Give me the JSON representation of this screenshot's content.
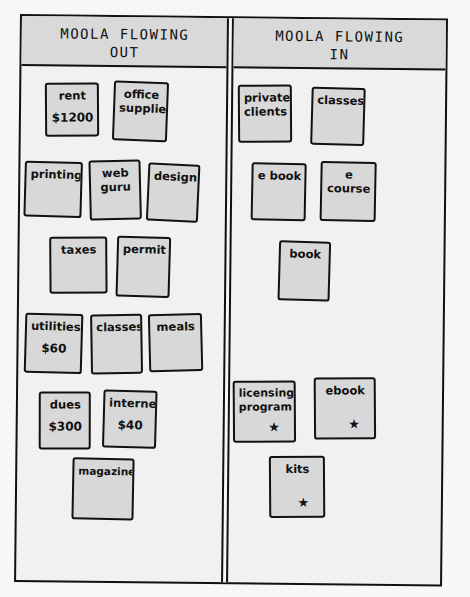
{
  "columns": {
    "out": {
      "title_line1": "MOOLA FLOWING",
      "title_line2": "OUT",
      "notes": [
        {
          "label": "rent",
          "amount": "$1200"
        },
        {
          "label": "office supplies",
          "amount": ""
        },
        {
          "label": "printing",
          "amount": ""
        },
        {
          "label": "web guru",
          "amount": ""
        },
        {
          "label": "design",
          "amount": ""
        },
        {
          "label": "taxes",
          "amount": ""
        },
        {
          "label": "permit",
          "amount": ""
        },
        {
          "label": "utilities",
          "amount": "$60"
        },
        {
          "label": "classes",
          "amount": ""
        },
        {
          "label": "meals",
          "amount": ""
        },
        {
          "label": "dues",
          "amount": "$300"
        },
        {
          "label": "internet",
          "amount": "$40"
        },
        {
          "label": "magazines",
          "amount": ""
        }
      ]
    },
    "in": {
      "title_line1": "MOOLA FLOWING",
      "title_line2": "IN",
      "notes": [
        {
          "label": "private clients",
          "star": ""
        },
        {
          "label": "classes",
          "star": ""
        },
        {
          "label": "e book",
          "star": ""
        },
        {
          "label": "e course",
          "star": ""
        },
        {
          "label": "book",
          "star": ""
        },
        {
          "label": "licensing program",
          "star": "★"
        },
        {
          "label": "ebook",
          "star": "★"
        },
        {
          "label": "kits",
          "star": "★"
        }
      ]
    }
  },
  "colors": {
    "header_fill": "#d9d9d9",
    "note_fill": "#d8d8d8",
    "ink": "#111111",
    "paper": "#f1f1f1"
  }
}
